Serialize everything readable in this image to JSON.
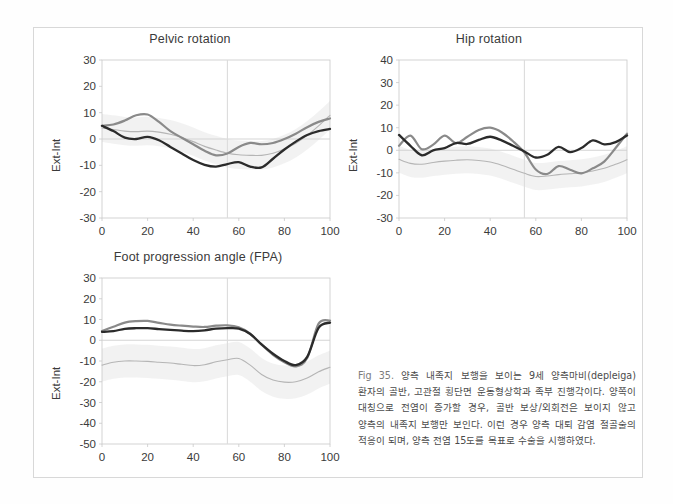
{
  "figure": {
    "caption_label": "Fig 35.",
    "caption_text": "양측 내족지 보행을 보이는 9세 양측마비(depleiga) 환자의 골반, 고관절 횡단면 운동형상학과 족부 진행각이다. 양쪽이 대칭으로 전염이 증가할 경우, 골반 보상/외회전은 보이지 않고 양측의 내족지 보행만 보인다. 이런 경우 양측 대퇴 감염 절골술의 적응이 되며, 양측 전염 15도를 목표로 수술을 시행하였다.",
    "colors": {
      "line_dark": "#2b2b2b",
      "line_gray": "#8a8a8a",
      "line_light": "#b5b5b5",
      "band": "#ededed",
      "axis": "#c9c9c9",
      "zero_line": "#d0d0d0",
      "event_line": "#dcdcdc",
      "frame": "#d8d8d8"
    }
  },
  "chart_data": [
    {
      "id": "pelvic-rotation",
      "type": "line",
      "title": "Pelvic rotation",
      "xlabel": "",
      "ylabel": "Ext-Int",
      "xlim": [
        0,
        100
      ],
      "ylim": [
        -30,
        30
      ],
      "xticks": [
        0,
        20,
        40,
        60,
        80,
        100
      ],
      "yticks": [
        30,
        20,
        10,
        0,
        -10,
        -20,
        -30
      ],
      "grid": false,
      "zero_line": 0,
      "event_line_x": 55,
      "legend": "none",
      "x": [
        0,
        5,
        10,
        15,
        20,
        25,
        30,
        35,
        40,
        45,
        50,
        55,
        60,
        65,
        70,
        75,
        80,
        85,
        90,
        95,
        100
      ],
      "series": [
        {
          "name": "right",
          "color": "#2b2b2b",
          "values": [
            5.0,
            3.0,
            0.5,
            0.0,
            0.8,
            -0.5,
            -3.0,
            -5.5,
            -8.0,
            -9.8,
            -10.5,
            -9.5,
            -8.8,
            -10.5,
            -10.8,
            -7.5,
            -4.0,
            -1.0,
            1.5,
            3.0,
            3.8
          ]
        },
        {
          "name": "left",
          "color": "#8a8a8a",
          "values": [
            5.0,
            5.5,
            7.0,
            9.0,
            9.3,
            6.5,
            3.0,
            0.5,
            -2.0,
            -4.5,
            -6.2,
            -5.5,
            -3.0,
            -1.5,
            -2.0,
            -1.5,
            0.0,
            2.0,
            4.5,
            6.5,
            7.8
          ]
        },
        {
          "name": "normal-mean",
          "color": "#b5b5b5",
          "values": [
            4.2,
            3.6,
            3.0,
            2.8,
            3.0,
            2.6,
            1.8,
            0.6,
            -1.0,
            -2.8,
            -4.2,
            -5.4,
            -6.0,
            -6.2,
            -6.2,
            -5.4,
            -3.8,
            -1.6,
            1.4,
            5.0,
            9.0
          ]
        }
      ],
      "band": {
        "name": "normal-range",
        "color": "#ededed",
        "upper": [
          9.5,
          9.0,
          8.4,
          8.2,
          8.4,
          8.0,
          7.2,
          6.0,
          4.4,
          2.6,
          1.2,
          0.0,
          -0.6,
          -0.8,
          -0.8,
          0.0,
          1.6,
          3.8,
          6.8,
          10.4,
          14.4
        ],
        "lower": [
          -1.1,
          -1.8,
          -2.4,
          -2.6,
          -2.4,
          -2.8,
          -3.6,
          -4.8,
          -6.4,
          -8.2,
          -9.6,
          -10.8,
          -11.4,
          -11.6,
          -11.6,
          -10.8,
          -9.2,
          -7.0,
          -4.0,
          -0.4,
          3.6
        ]
      }
    },
    {
      "id": "hip-rotation",
      "type": "line",
      "title": "Hip rotation",
      "xlabel": "",
      "ylabel": "Ext-Int",
      "xlim": [
        0,
        100
      ],
      "ylim": [
        -30,
        40
      ],
      "xticks": [
        0,
        20,
        40,
        60,
        80,
        100
      ],
      "yticks": [
        40,
        30,
        20,
        10,
        0,
        -10,
        -20,
        -30
      ],
      "grid": false,
      "zero_line": 0,
      "event_line_x": 55,
      "legend": "none",
      "x": [
        0,
        5,
        10,
        15,
        20,
        25,
        30,
        35,
        40,
        45,
        50,
        55,
        60,
        65,
        70,
        75,
        80,
        85,
        90,
        95,
        100
      ],
      "series": [
        {
          "name": "right",
          "color": "#2b2b2b",
          "values": [
            6.8,
            2.0,
            -2.2,
            0.0,
            1.0,
            3.2,
            2.8,
            4.6,
            6.0,
            4.4,
            2.0,
            -0.5,
            -3.2,
            -2.0,
            1.5,
            -0.8,
            1.0,
            4.4,
            2.6,
            3.6,
            6.6
          ]
        },
        {
          "name": "left",
          "color": "#8a8a8a",
          "values": [
            2.0,
            6.5,
            0.5,
            2.5,
            6.5,
            3.2,
            6.0,
            9.0,
            10.0,
            8.0,
            4.0,
            -1.0,
            -8.5,
            -10.5,
            -7.0,
            -8.6,
            -10.2,
            -8.0,
            -5.0,
            1.0,
            7.4
          ]
        },
        {
          "name": "normal-mean",
          "color": "#b5b5b5",
          "values": [
            -4.0,
            -5.8,
            -6.2,
            -5.4,
            -4.8,
            -4.4,
            -4.2,
            -4.5,
            -5.2,
            -6.6,
            -8.4,
            -10.2,
            -11.6,
            -11.4,
            -10.8,
            -10.4,
            -10.0,
            -9.2,
            -8.0,
            -6.2,
            -4.2
          ]
        }
      ],
      "band": {
        "name": "normal-range",
        "color": "#ededed",
        "upper": [
          2.0,
          0.2,
          -0.2,
          0.6,
          1.2,
          1.6,
          1.8,
          1.5,
          0.8,
          -0.6,
          -2.4,
          -4.2,
          -5.6,
          -5.4,
          -4.8,
          -4.4,
          -4.0,
          -3.2,
          -2.0,
          -0.2,
          1.8
        ],
        "lower": [
          -10.0,
          -11.8,
          -12.2,
          -11.4,
          -10.8,
          -10.4,
          -10.2,
          -10.5,
          -11.2,
          -12.6,
          -14.4,
          -16.2,
          -17.6,
          -17.4,
          -16.8,
          -16.4,
          -16.0,
          -15.2,
          -14.0,
          -12.2,
          -10.2
        ]
      }
    },
    {
      "id": "foot-progression-angle",
      "type": "line",
      "title": "Foot progression angle (FPA)",
      "xlabel": "",
      "ylabel": "Ext-Int",
      "xlim": [
        0,
        100
      ],
      "ylim": [
        -50,
        30
      ],
      "xticks": [
        0,
        20,
        40,
        60,
        80,
        100
      ],
      "yticks": [
        30,
        20,
        10,
        0,
        -10,
        -20,
        -30,
        -40,
        -50
      ],
      "grid": false,
      "zero_line": 0,
      "event_line_x": 55,
      "legend": "none",
      "x": [
        0,
        5,
        10,
        15,
        20,
        25,
        30,
        35,
        40,
        45,
        50,
        55,
        60,
        65,
        70,
        75,
        80,
        85,
        90,
        95,
        100
      ],
      "series": [
        {
          "name": "right",
          "color": "#2b2b2b",
          "values": [
            4.0,
            4.4,
            5.5,
            5.8,
            5.8,
            5.4,
            5.0,
            4.6,
            4.4,
            4.8,
            5.6,
            5.8,
            5.6,
            3.0,
            -2.0,
            -6.5,
            -10.0,
            -12.0,
            -8.0,
            6.0,
            8.5
          ]
        },
        {
          "name": "left",
          "color": "#8a8a8a",
          "values": [
            4.5,
            6.5,
            8.5,
            9.2,
            9.3,
            8.4,
            7.5,
            7.0,
            6.6,
            6.4,
            7.0,
            7.2,
            6.2,
            3.2,
            -2.2,
            -7.0,
            -10.6,
            -12.6,
            -8.6,
            8.0,
            9.5
          ]
        },
        {
          "name": "normal-mean",
          "color": "#b5b5b5",
          "values": [
            -12.0,
            -10.6,
            -10.0,
            -10.0,
            -10.2,
            -10.6,
            -11.0,
            -11.6,
            -12.2,
            -11.8,
            -10.4,
            -9.4,
            -8.8,
            -12.0,
            -16.5,
            -19.2,
            -20.2,
            -20.0,
            -18.2,
            -15.2,
            -13.0
          ]
        }
      ],
      "band": {
        "name": "normal-range",
        "color": "#ededed",
        "upper": [
          -4.0,
          -2.6,
          -2.0,
          -2.0,
          -2.2,
          -2.6,
          -3.0,
          -3.6,
          -4.2,
          -3.8,
          -2.4,
          -1.4,
          -0.8,
          -4.0,
          -8.5,
          -11.2,
          -12.2,
          -12.0,
          -10.2,
          -7.2,
          -5.0
        ],
        "lower": [
          -20.0,
          -18.6,
          -18.0,
          -18.0,
          -18.2,
          -18.6,
          -19.0,
          -19.6,
          -20.2,
          -19.8,
          -18.4,
          -17.4,
          -16.8,
          -20.0,
          -24.5,
          -27.2,
          -28.2,
          -28.0,
          -26.2,
          -23.2,
          -21.0
        ]
      }
    }
  ]
}
